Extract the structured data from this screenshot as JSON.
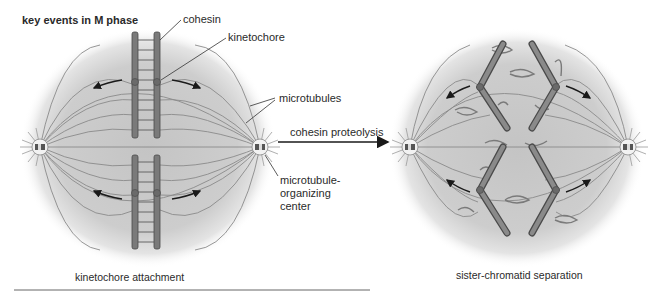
{
  "title": "key events in M phase",
  "left_panel": {
    "caption": "kinetochore attachment",
    "labels": {
      "cohesin": "cohesin",
      "kinetochore": "kinetochore",
      "microtubules": "microtubules",
      "mtoc_line1": "microtubule-",
      "mtoc_line2": "organizing",
      "mtoc_line3": "center"
    }
  },
  "transition": {
    "label": "cohesin proteolysis"
  },
  "right_panel": {
    "caption": "sister-chromatid separation"
  },
  "colors": {
    "cell_fill": "#c8c8c8",
    "chromatid": "#7a7a7a",
    "chromatid_edge": "#4a4a4a",
    "microtubule": "#8a8a8a",
    "arrow": "#1a1a1a",
    "rule": "#666666"
  }
}
